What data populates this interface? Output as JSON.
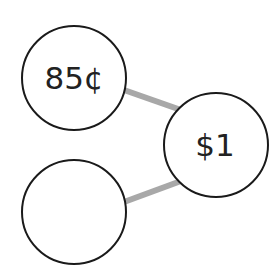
{
  "diagram": {
    "type": "number-bond",
    "whole": {
      "label": "$1"
    },
    "parts": [
      {
        "label": "85¢"
      },
      {
        "label": ""
      }
    ],
    "colors": {
      "circle_stroke": "#1a1a1a",
      "connector": "#a8a8a8",
      "text": "#222222",
      "background": "#ffffff"
    }
  }
}
